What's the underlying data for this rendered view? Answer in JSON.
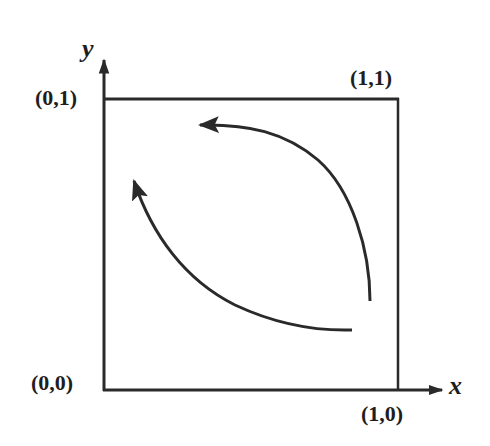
{
  "diagram": {
    "axes": {
      "x_label": "x",
      "y_label": "y"
    },
    "corners": {
      "origin": "(0,0)",
      "top_left": "(0,1)",
      "top_right": "(1,1)",
      "bottom_right": "(1,0)"
    },
    "arrows": [
      {
        "name": "outer-arc",
        "direction": "counter-clockwise",
        "from": "near (1,0) side",
        "to": "near top edge"
      },
      {
        "name": "inner-arc",
        "direction": "counter-clockwise",
        "from": "near bottom edge",
        "to": "near (0,1) side"
      }
    ],
    "colors": {
      "stroke": "#2a2a2a",
      "background": "#ffffff"
    }
  }
}
